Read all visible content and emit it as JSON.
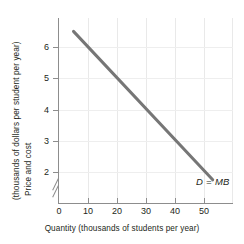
{
  "chart_data": {
    "type": "line",
    "title": "",
    "xlabel": "Quantity (thousands of students per year)",
    "ylabel_line1": "Price and cost",
    "ylabel_line2": "(thousands of dollars per student per year)",
    "ylabel_full": "Price and cost (thousands of dollars per student per year)",
    "xlim": [
      0,
      60
    ],
    "ylim": [
      1.5,
      7
    ],
    "xticks": [
      0,
      10,
      20,
      30,
      40,
      50
    ],
    "yticks": [
      2,
      3,
      4,
      5,
      6
    ],
    "xtick_labels": [
      "0",
      "10",
      "20",
      "30",
      "40",
      "50"
    ],
    "ytick_labels": [
      "2",
      "3",
      "4",
      "5",
      "6"
    ],
    "grid": "vertical-faint",
    "y_axis_break": true,
    "legend_position": "inline-right",
    "series": [
      {
        "name": "D = MB",
        "label": "D = MB",
        "color": "#767676",
        "x": [
          5,
          53
        ],
        "y": [
          6.5,
          1.75
        ],
        "points": [
          [
            5,
            6.5
          ],
          [
            10,
            6.0
          ],
          [
            20,
            5.0
          ],
          [
            30,
            4.0
          ],
          [
            40,
            3.0
          ],
          [
            50,
            2.05
          ],
          [
            53,
            1.75
          ]
        ],
        "slope": -0.099,
        "intercept": 6.995
      }
    ],
    "annotations": [
      {
        "text": "D = MB",
        "x": 50,
        "y": 1.95,
        "style": "italic"
      }
    ]
  }
}
